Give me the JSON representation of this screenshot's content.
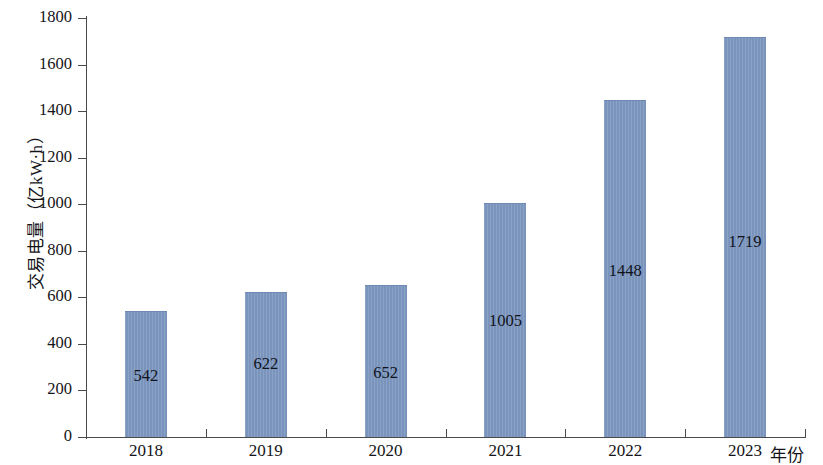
{
  "chart_data": {
    "type": "bar",
    "title": "",
    "subtitle": "",
    "xlabel": "年份",
    "ylabel": "交易电量（亿kW·h）",
    "categories": [
      "2018",
      "2019",
      "2020",
      "2021",
      "2022",
      "2023"
    ],
    "values": [
      542,
      622,
      652,
      1005,
      1448,
      1719
    ],
    "value_labels": [
      "542",
      "622",
      "652",
      "1005",
      "1448",
      "1719"
    ],
    "ylim": [
      0,
      1800
    ],
    "yticks": [
      0,
      200,
      400,
      600,
      800,
      1000,
      1200,
      1400,
      1600,
      1800
    ],
    "ytick_labels": [
      "0",
      "200",
      "400",
      "600",
      "800",
      "1000",
      "1200",
      "1400",
      "1600",
      "1800"
    ],
    "grid": false,
    "legend": null,
    "series": [
      {
        "name": "交易电量",
        "values": [
          542,
          622,
          652,
          1005,
          1448,
          1719
        ]
      }
    ],
    "colors": {
      "bar_fill": "#7c97c0",
      "bar_edge": "#6d89b4",
      "axis": "#4a4a4a",
      "text": "#141419",
      "background": "#ffffff"
    },
    "label_position": "inside-bar"
  }
}
